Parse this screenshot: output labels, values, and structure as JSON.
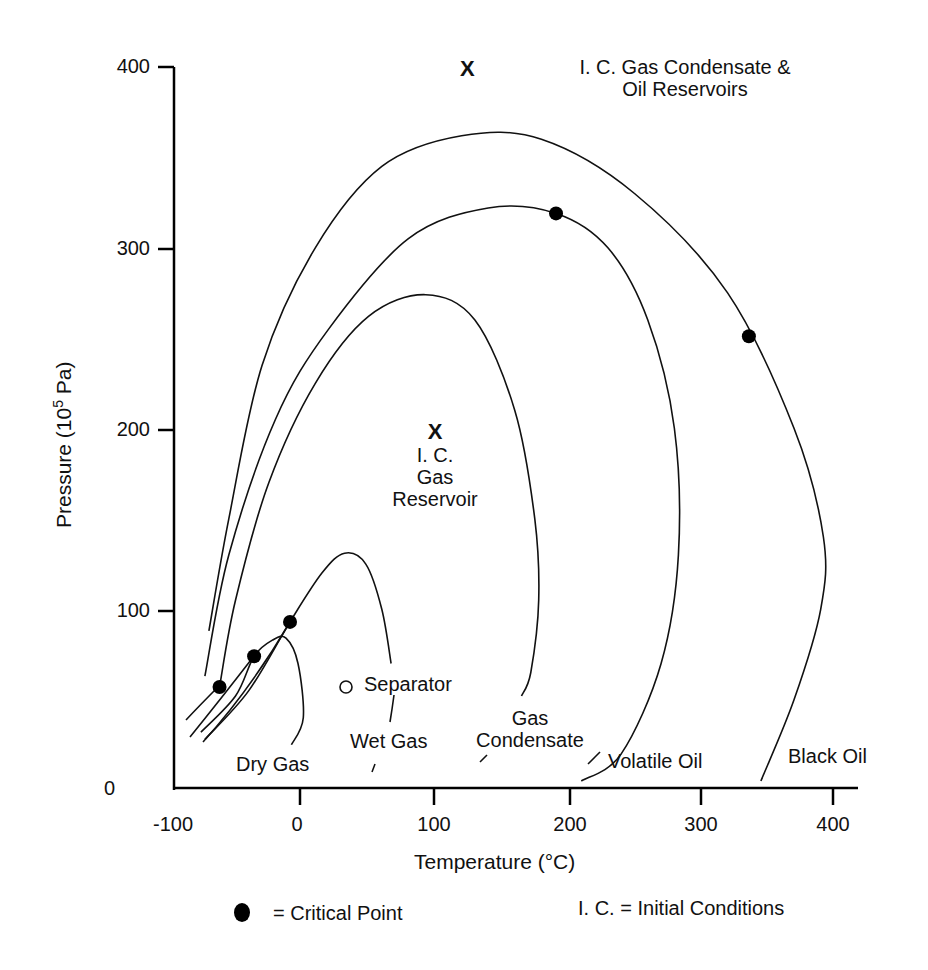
{
  "chart_data": {
    "type": "line",
    "title": "",
    "xlabel": "Temperature (°C)",
    "ylabel": "Pressure (10^5 Pa)",
    "ylabel_parts": {
      "prefix": "Pressure (10",
      "sup": "5",
      "suffix": " Pa)"
    },
    "xlim": [
      -100,
      420
    ],
    "ylim": [
      0,
      400
    ],
    "x_ticks": [
      "-100",
      "0",
      "100",
      "200",
      "300",
      "400"
    ],
    "y_ticks": [
      "0",
      "100",
      "200",
      "300",
      "400"
    ],
    "grid": false,
    "series": [
      {
        "name": "Black Oil",
        "points": [
          [
            -70,
            88
          ],
          [
            -55,
            150
          ],
          [
            -30,
            235
          ],
          [
            10,
            300
          ],
          [
            60,
            345
          ],
          [
            120,
            362
          ],
          [
            180,
            360
          ],
          [
            250,
            330
          ],
          [
            320,
            275
          ],
          [
            370,
            200
          ],
          [
            392,
            140
          ],
          [
            390,
            100
          ],
          [
            370,
            50
          ],
          [
            345,
            5
          ]
        ]
      },
      {
        "name": "Volatile Oil",
        "points": [
          [
            -73,
            63
          ],
          [
            -55,
            130
          ],
          [
            -20,
            205
          ],
          [
            20,
            255
          ],
          [
            80,
            305
          ],
          [
            140,
            322
          ],
          [
            191,
            319
          ],
          [
            230,
            300
          ],
          [
            260,
            260
          ],
          [
            280,
            200
          ],
          [
            283,
            130
          ],
          [
            270,
            70
          ],
          [
            240,
            20
          ],
          [
            210,
            5
          ]
        ]
      },
      {
        "name": "Gas Condensate",
        "points": [
          [
            -62,
            57
          ],
          [
            -50,
            105
          ],
          [
            -25,
            170
          ],
          [
            10,
            225
          ],
          [
            50,
            262
          ],
          [
            93,
            274
          ],
          [
            130,
            260
          ],
          [
            160,
            210
          ],
          [
            175,
            150
          ],
          [
            178,
            105
          ],
          [
            172,
            65
          ],
          [
            165,
            52
          ]
        ]
      },
      {
        "name": "Wet Gas",
        "points": [
          [
            -73,
            28
          ],
          [
            -40,
            55
          ],
          [
            -9,
            93
          ],
          [
            15,
            120
          ],
          [
            32,
            131
          ],
          [
            48,
            125
          ],
          [
            60,
            100
          ],
          [
            67,
            70
          ]
        ]
      },
      {
        "name": "Dry Gas",
        "points": [
          [
            -76,
            32
          ],
          [
            -50,
            52
          ],
          [
            -36,
            74
          ],
          [
            -22,
            83
          ],
          [
            -12,
            84
          ],
          [
            -3,
            70
          ],
          [
            1,
            40
          ],
          [
            -8,
            25
          ]
        ]
      }
    ],
    "critical_points": [
      [
        -62,
        57
      ],
      [
        -36,
        74
      ],
      [
        -9,
        93
      ],
      [
        191,
        319
      ],
      [
        336,
        251
      ]
    ],
    "separator_point": [
      35,
      57
    ],
    "initial_conditions": [
      {
        "label": "I. C. Gas Reservoir",
        "T": 100,
        "P": 197
      },
      {
        "label": "I. C. Gas Condensate & Oil Reservoirs",
        "T": 126,
        "P": 397
      }
    ],
    "annotations": [
      "Dry Gas",
      "Wet Gas",
      "Gas Condensate",
      "Volatile Oil",
      "Black Oil",
      "Separator"
    ]
  },
  "labels": {
    "ic_top_x": "X",
    "ic_top_line1": "I. C. Gas Condensate &",
    "ic_top_line2": "Oil Reservoirs",
    "ic_mid_x": "X",
    "ic_mid_line1": "I. C.",
    "ic_mid_line2": "Gas",
    "ic_mid_line3": "Reservoir",
    "separator": "Separator",
    "dry_gas": "Dry Gas",
    "wet_gas": "Wet Gas",
    "gas_condensate_1": "Gas",
    "gas_condensate_2": "Condensate",
    "volatile_oil": "Volatile Oil",
    "black_oil": "Black Oil"
  },
  "legend": {
    "critical_point": "=  Critical Point",
    "initial_conditions": "I. C.  =  Initial Conditions"
  }
}
